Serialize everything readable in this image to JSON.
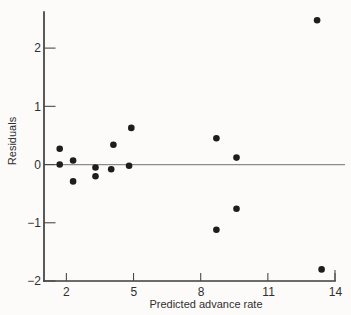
{
  "figure": {
    "background": "#fcfbf9"
  },
  "chart_data": {
    "type": "scatter",
    "title": "",
    "xlabel": "Predicted advance rate",
    "ylabel": "Residuals",
    "xlim": [
      1,
      14
    ],
    "ylim": [
      -2,
      2.62
    ],
    "xticks": [
      2,
      5,
      8,
      11,
      14
    ],
    "yticks": [
      2,
      1,
      0,
      -1,
      -2
    ],
    "xtick_labels": [
      "2",
      "5",
      "8",
      "11",
      "14"
    ],
    "ytick_labels": [
      "2",
      "1",
      "0",
      "−1",
      "−2"
    ],
    "grid": false,
    "legend": null,
    "zero_line_y": 0,
    "point_color": "#1d1d1d",
    "axis_color": "#3d3d3d",
    "points": [
      {
        "x": 1.7,
        "y": 0.27
      },
      {
        "x": 1.7,
        "y": 0.0
      },
      {
        "x": 2.3,
        "y": 0.07
      },
      {
        "x": 2.3,
        "y": -0.29
      },
      {
        "x": 3.3,
        "y": -0.05
      },
      {
        "x": 3.3,
        "y": -0.2
      },
      {
        "x": 4.1,
        "y": 0.34
      },
      {
        "x": 4.0,
        "y": -0.08
      },
      {
        "x": 4.9,
        "y": 0.63
      },
      {
        "x": 4.8,
        "y": -0.02
      },
      {
        "x": 8.7,
        "y": 0.45
      },
      {
        "x": 8.7,
        "y": -1.12
      },
      {
        "x": 9.6,
        "y": 0.12
      },
      {
        "x": 9.6,
        "y": -0.76
      },
      {
        "x": 13.2,
        "y": 2.48
      },
      {
        "x": 13.4,
        "y": -1.8
      }
    ]
  }
}
